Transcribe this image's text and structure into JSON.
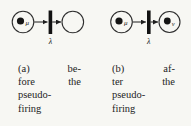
{
  "figure": {
    "colors": {
      "ink": "#1b1b1b",
      "background": "#f7f7f3"
    },
    "panels": [
      {
        "label": "a",
        "left_place": {
          "has_token": true,
          "token_label": "μ"
        },
        "transition": {
          "label": "λ"
        },
        "right_place": {
          "has_token": false,
          "token_label": ""
        },
        "caption": {
          "line1_left": "(a)",
          "line1_right": "be-",
          "line2_left": "fore",
          "line2_right": "the",
          "line3": "pseudo-",
          "line4": "firing",
          "full_text": "(a) before the pseudo-firing"
        }
      },
      {
        "label": "b",
        "left_place": {
          "has_token": true,
          "token_label": "μ"
        },
        "transition": {
          "label": "λ"
        },
        "right_place": {
          "has_token": true,
          "token_label": "ν"
        },
        "caption": {
          "line1_left": "(b)",
          "line1_right": "af-",
          "line2_left": "ter",
          "line2_right": "the",
          "line3": "pseudo-",
          "line4": "firing",
          "full_text": "(b) after the pseudo-firing"
        }
      }
    ]
  }
}
